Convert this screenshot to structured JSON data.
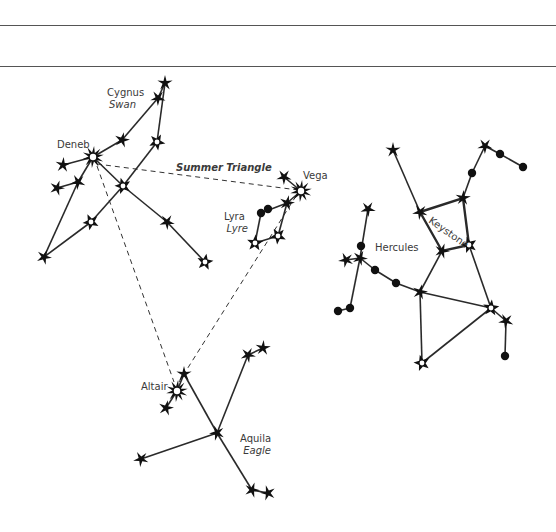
{
  "page": {
    "rules_y": [
      25,
      66
    ]
  },
  "colors": {
    "line": "#2a2a2a",
    "star": "#111111",
    "label": "#3a3a3a"
  },
  "labels": [
    {
      "id": "cygnus",
      "text": "Cygnus",
      "x": 107,
      "y": 96,
      "style": "normal",
      "anchor": "start"
    },
    {
      "id": "swan",
      "text": "Swan",
      "x": 136,
      "y": 108,
      "style": "italic",
      "anchor": "end"
    },
    {
      "id": "deneb",
      "text": "Deneb",
      "x": 57,
      "y": 148,
      "style": "normal",
      "anchor": "start"
    },
    {
      "id": "summer-triangle",
      "text": "Summer Triangle",
      "x": 176,
      "y": 171,
      "style": "bold-italic",
      "anchor": "start"
    },
    {
      "id": "vega",
      "text": "Vega",
      "x": 303,
      "y": 179,
      "style": "normal",
      "anchor": "start"
    },
    {
      "id": "lyra",
      "text": "Lyra",
      "x": 224,
      "y": 220,
      "style": "normal",
      "anchor": "start"
    },
    {
      "id": "lyre",
      "text": "Lyre",
      "x": 248,
      "y": 232,
      "style": "italic",
      "anchor": "end"
    },
    {
      "id": "hercules",
      "text": "Hercules",
      "x": 375,
      "y": 251,
      "style": "normal",
      "anchor": "start"
    },
    {
      "id": "keystone",
      "text": "Keystone",
      "x": 428,
      "y": 222,
      "style": "normal",
      "anchor": "start",
      "rotate": 35
    },
    {
      "id": "altair",
      "text": "Altair",
      "x": 141,
      "y": 390,
      "style": "normal",
      "anchor": "start"
    },
    {
      "id": "aquila",
      "text": "Aquila",
      "x": 240,
      "y": 442,
      "style": "normal",
      "anchor": "start"
    },
    {
      "id": "eagle",
      "text": "Eagle",
      "x": 271,
      "y": 454,
      "style": "italic",
      "anchor": "end"
    }
  ],
  "summer_triangle": {
    "label": "Summer Triangle",
    "segments": [
      [
        [
          97,
          164
        ],
        [
          298,
          190
        ]
      ],
      [
        [
          97,
          166
        ],
        [
          174,
          382
        ]
      ],
      [
        [
          296,
          196
        ],
        [
          179,
          382
        ]
      ]
    ]
  },
  "constellations": [
    {
      "name": "Cygnus",
      "common_name": "Swan",
      "stars": [
        {
          "x": 165,
          "y": 83,
          "type": "filled"
        },
        {
          "x": 158,
          "y": 98,
          "type": "filled"
        },
        {
          "x": 122,
          "y": 140,
          "type": "filled"
        },
        {
          "x": 93,
          "y": 157,
          "type": "bright",
          "name": "Deneb"
        },
        {
          "x": 157,
          "y": 142,
          "type": "open"
        },
        {
          "x": 63,
          "y": 165,
          "type": "filled"
        },
        {
          "x": 78,
          "y": 182,
          "type": "filled"
        },
        {
          "x": 57,
          "y": 188,
          "type": "filled"
        },
        {
          "x": 123,
          "y": 186,
          "type": "open"
        },
        {
          "x": 167,
          "y": 222,
          "type": "filled"
        },
        {
          "x": 205,
          "y": 262,
          "type": "open"
        },
        {
          "x": 91,
          "y": 222,
          "type": "open"
        },
        {
          "x": 44,
          "y": 257,
          "type": "filled"
        }
      ],
      "lines": [
        [
          [
            165,
            83
          ],
          [
            158,
            98
          ]
        ],
        [
          [
            158,
            98
          ],
          [
            122,
            140
          ]
        ],
        [
          [
            122,
            140
          ],
          [
            93,
            157
          ]
        ],
        [
          [
            165,
            83
          ],
          [
            157,
            142
          ]
        ],
        [
          [
            157,
            142
          ],
          [
            123,
            186
          ]
        ],
        [
          [
            123,
            186
          ],
          [
            91,
            222
          ]
        ],
        [
          [
            91,
            222
          ],
          [
            44,
            257
          ]
        ],
        [
          [
            93,
            157
          ],
          [
            63,
            165
          ]
        ],
        [
          [
            93,
            157
          ],
          [
            78,
            182
          ]
        ],
        [
          [
            78,
            182
          ],
          [
            57,
            188
          ]
        ],
        [
          [
            78,
            182
          ],
          [
            44,
            257
          ]
        ],
        [
          [
            93,
            157
          ],
          [
            123,
            186
          ]
        ],
        [
          [
            123,
            186
          ],
          [
            167,
            222
          ]
        ],
        [
          [
            167,
            222
          ],
          [
            205,
            262
          ]
        ]
      ]
    },
    {
      "name": "Lyra",
      "common_name": "Lyre",
      "stars": [
        {
          "x": 301,
          "y": 191,
          "type": "bright",
          "name": "Vega"
        },
        {
          "x": 284,
          "y": 177,
          "type": "filled"
        },
        {
          "x": 287,
          "y": 203,
          "type": "filled"
        },
        {
          "x": 261,
          "y": 213,
          "type": "dot"
        },
        {
          "x": 268,
          "y": 209,
          "type": "dot"
        },
        {
          "x": 255,
          "y": 243,
          "type": "open"
        },
        {
          "x": 278,
          "y": 236,
          "type": "open"
        }
      ],
      "lines": [
        [
          [
            284,
            177
          ],
          [
            301,
            191
          ]
        ],
        [
          [
            301,
            191
          ],
          [
            287,
            203
          ]
        ],
        [
          [
            287,
            203
          ],
          [
            261,
            213
          ]
        ],
        [
          [
            261,
            213
          ],
          [
            255,
            243
          ]
        ],
        [
          [
            255,
            243
          ],
          [
            278,
            236
          ]
        ],
        [
          [
            278,
            236
          ],
          [
            287,
            203
          ]
        ]
      ]
    },
    {
      "name": "Hercules",
      "keystone_label": "Keystone",
      "stars": [
        {
          "x": 393,
          "y": 150,
          "type": "filled"
        },
        {
          "x": 485,
          "y": 146,
          "type": "filled"
        },
        {
          "x": 500,
          "y": 154,
          "type": "dot"
        },
        {
          "x": 523,
          "y": 167,
          "type": "dot"
        },
        {
          "x": 472,
          "y": 173,
          "type": "dot"
        },
        {
          "x": 463,
          "y": 198,
          "type": "filled"
        },
        {
          "x": 420,
          "y": 212,
          "type": "filled"
        },
        {
          "x": 442,
          "y": 251,
          "type": "filled"
        },
        {
          "x": 469,
          "y": 245,
          "type": "open"
        },
        {
          "x": 368,
          "y": 209,
          "type": "filled"
        },
        {
          "x": 361,
          "y": 246,
          "type": "dot"
        },
        {
          "x": 346,
          "y": 260,
          "type": "filled"
        },
        {
          "x": 360,
          "y": 258,
          "type": "filled"
        },
        {
          "x": 375,
          "y": 270,
          "type": "dot"
        },
        {
          "x": 396,
          "y": 283,
          "type": "dot"
        },
        {
          "x": 420,
          "y": 292,
          "type": "filled"
        },
        {
          "x": 350,
          "y": 308,
          "type": "dot"
        },
        {
          "x": 338,
          "y": 311,
          "type": "dot"
        },
        {
          "x": 491,
          "y": 308,
          "type": "open"
        },
        {
          "x": 506,
          "y": 321,
          "type": "filled"
        },
        {
          "x": 505,
          "y": 356,
          "type": "dot"
        },
        {
          "x": 422,
          "y": 363,
          "type": "open"
        }
      ],
      "keystone": [
        [
          420,
          212
        ],
        [
          463,
          198
        ],
        [
          469,
          245
        ],
        [
          442,
          251
        ]
      ],
      "lines": [
        [
          [
            393,
            150
          ],
          [
            420,
            212
          ]
        ],
        [
          [
            485,
            146
          ],
          [
            500,
            154
          ]
        ],
        [
          [
            500,
            154
          ],
          [
            523,
            167
          ]
        ],
        [
          [
            485,
            146
          ],
          [
            472,
            173
          ]
        ],
        [
          [
            472,
            173
          ],
          [
            463,
            198
          ]
        ],
        [
          [
            442,
            251
          ],
          [
            420,
            292
          ]
        ],
        [
          [
            469,
            245
          ],
          [
            491,
            308
          ]
        ],
        [
          [
            368,
            209
          ],
          [
            360,
            258
          ]
        ],
        [
          [
            346,
            260
          ],
          [
            360,
            258
          ]
        ],
        [
          [
            360,
            258
          ],
          [
            375,
            270
          ]
        ],
        [
          [
            375,
            270
          ],
          [
            396,
            283
          ]
        ],
        [
          [
            396,
            283
          ],
          [
            420,
            292
          ]
        ],
        [
          [
            360,
            258
          ],
          [
            350,
            308
          ]
        ],
        [
          [
            350,
            308
          ],
          [
            338,
            311
          ]
        ],
        [
          [
            420,
            292
          ],
          [
            491,
            308
          ]
        ],
        [
          [
            420,
            292
          ],
          [
            422,
            363
          ]
        ],
        [
          [
            422,
            363
          ],
          [
            491,
            308
          ]
        ],
        [
          [
            491,
            308
          ],
          [
            506,
            321
          ]
        ],
        [
          [
            506,
            321
          ],
          [
            505,
            356
          ]
        ]
      ]
    },
    {
      "name": "Aquila",
      "common_name": "Eagle",
      "stars": [
        {
          "x": 184,
          "y": 374,
          "type": "filled"
        },
        {
          "x": 177,
          "y": 391,
          "type": "bright",
          "name": "Altair"
        },
        {
          "x": 166,
          "y": 408,
          "type": "filled"
        },
        {
          "x": 217,
          "y": 433,
          "type": "filled"
        },
        {
          "x": 248,
          "y": 355,
          "type": "filled"
        },
        {
          "x": 263,
          "y": 348,
          "type": "filled"
        },
        {
          "x": 141,
          "y": 459,
          "type": "filled"
        },
        {
          "x": 252,
          "y": 490,
          "type": "filled"
        },
        {
          "x": 268,
          "y": 493,
          "type": "filled"
        }
      ],
      "lines": [
        [
          [
            184,
            374
          ],
          [
            177,
            391
          ]
        ],
        [
          [
            177,
            391
          ],
          [
            166,
            408
          ]
        ],
        [
          [
            184,
            374
          ],
          [
            217,
            433
          ]
        ],
        [
          [
            217,
            433
          ],
          [
            248,
            355
          ]
        ],
        [
          [
            248,
            355
          ],
          [
            263,
            348
          ]
        ],
        [
          [
            217,
            433
          ],
          [
            141,
            459
          ]
        ],
        [
          [
            217,
            433
          ],
          [
            252,
            490
          ]
        ],
        [
          [
            252,
            490
          ],
          [
            268,
            493
          ]
        ]
      ]
    }
  ]
}
